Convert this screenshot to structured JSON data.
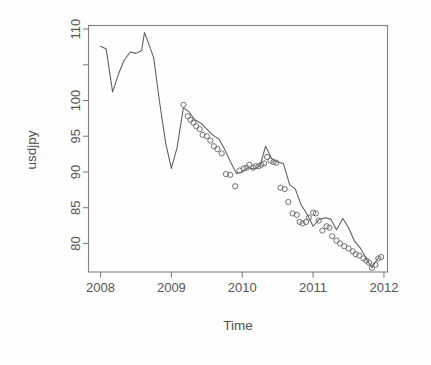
{
  "figure": {
    "background_color": "#fefefe",
    "frame_color": "#808080",
    "line_color": "#5d5d5d",
    "point_color": "#6a6a6a"
  },
  "axis": {
    "x_title": "Time",
    "y_title": "usdjpy",
    "x_tick_labels": [
      "2008",
      "2009",
      "2010",
      "2011",
      "2012"
    ],
    "y_tick_labels": [
      "80",
      "85",
      "90",
      "95",
      "100",
      "110"
    ]
  },
  "chart_data": {
    "type": "line",
    "title": "",
    "subtitle": "",
    "xlabel": "Time",
    "ylabel": "usdjpy",
    "xlim": [
      2007.83,
      2012.05
    ],
    "ylim": [
      76.0,
      110.5
    ],
    "xticks": [
      2008,
      2009,
      2010,
      2011,
      2012
    ],
    "xticklabels": [
      "2008",
      "2009",
      "2010",
      "2011",
      "2012"
    ],
    "yticks": [
      80,
      85,
      90,
      95,
      100,
      105,
      110
    ],
    "yticklabels": [
      "80",
      "85",
      "90",
      "95",
      "100",
      "",
      "110"
    ],
    "grid": false,
    "legend": null,
    "legend_position": "none",
    "annotations": [],
    "series": [
      {
        "name": "usdjpy",
        "style": "line",
        "x": [
          2008.0,
          2008.08,
          2008.17,
          2008.25,
          2008.33,
          2008.42,
          2008.5,
          2008.58,
          2008.62,
          2008.67,
          2008.75,
          2008.83,
          2008.92,
          2009.0,
          2009.08,
          2009.17,
          2009.25,
          2009.33,
          2009.42,
          2009.5,
          2009.58,
          2009.67,
          2009.75,
          2009.83,
          2009.92,
          2010.0,
          2010.08,
          2010.17,
          2010.25,
          2010.33,
          2010.42,
          2010.5,
          2010.58,
          2010.67,
          2010.75,
          2010.83,
          2010.92,
          2011.0,
          2011.08,
          2011.17,
          2011.25,
          2011.33,
          2011.42,
          2011.5,
          2011.58,
          2011.67,
          2011.75,
          2011.83,
          2011.92
        ],
        "y": [
          107.6,
          107.2,
          101.2,
          103.6,
          105.6,
          106.8,
          106.6,
          107.0,
          109.5,
          108.2,
          106.0,
          100.0,
          94.0,
          90.5,
          93.4,
          99.0,
          98.4,
          97.3,
          96.8,
          96.0,
          95.2,
          94.6,
          93.2,
          91.5,
          89.8,
          90.0,
          90.6,
          90.4,
          90.9,
          93.6,
          91.8,
          91.4,
          91.2,
          88.2,
          87.6,
          85.4,
          84.0,
          82.4,
          83.3,
          83.6,
          83.4,
          81.9,
          83.5,
          82.2,
          80.4,
          79.3,
          77.9,
          76.6,
          78.0
        ]
      },
      {
        "name": "usdjpy-observations",
        "style": "points",
        "marker": "open-circle",
        "x": [
          2009.17,
          2009.23,
          2009.27,
          2009.31,
          2009.35,
          2009.4,
          2009.44,
          2009.5,
          2009.55,
          2009.6,
          2009.65,
          2009.71,
          2009.77,
          2009.83,
          2009.9,
          2009.96,
          2010.02,
          2010.06,
          2010.1,
          2010.15,
          2010.19,
          2010.23,
          2010.27,
          2010.31,
          2010.35,
          2010.4,
          2010.44,
          2010.48,
          2010.54,
          2010.6,
          2010.65,
          2010.71,
          2010.77,
          2010.81,
          2010.85,
          2010.9,
          2010.94,
          2011.0,
          2011.04,
          2011.08,
          2011.13,
          2011.19,
          2011.23,
          2011.27,
          2011.33,
          2011.38,
          2011.44,
          2011.5,
          2011.56,
          2011.6,
          2011.65,
          2011.71,
          2011.75,
          2011.79,
          2011.83,
          2011.88,
          2011.92,
          2011.96
        ],
        "y": [
          99.4,
          97.8,
          97.3,
          96.9,
          96.4,
          96.0,
          95.2,
          95.0,
          94.4,
          93.6,
          93.2,
          92.6,
          89.7,
          89.6,
          88.0,
          90.2,
          90.5,
          90.6,
          91.0,
          90.6,
          90.8,
          90.8,
          91.0,
          91.2,
          92.1,
          91.6,
          91.4,
          91.3,
          87.8,
          87.6,
          85.8,
          84.2,
          84.0,
          83.0,
          82.8,
          83.0,
          83.6,
          84.3,
          84.2,
          83.2,
          81.8,
          82.4,
          82.2,
          81.0,
          80.4,
          80.0,
          79.6,
          79.3,
          78.9,
          78.5,
          78.3,
          77.9,
          77.6,
          77.3,
          76.6,
          77.0,
          77.9,
          78.1
        ]
      }
    ]
  }
}
